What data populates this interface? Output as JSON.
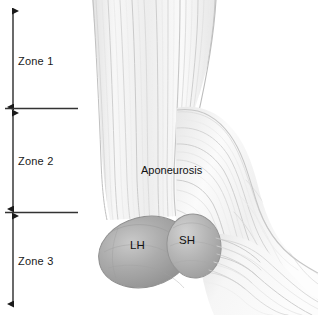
{
  "figure": {
    "background_color": "#ffffff",
    "width": 318,
    "height": 315
  },
  "zone_scale": {
    "axis_color": "#1a1a1a",
    "divider_color": "#333333",
    "zones": [
      {
        "id": "zone-1",
        "label": "Zone 1",
        "top_y": 10,
        "bottom_y": 108,
        "label_x": 18,
        "label_y": 55
      },
      {
        "id": "zone-2",
        "label": "Zone 2",
        "top_y": 110,
        "bottom_y": 210,
        "label_x": 18,
        "label_y": 155
      },
      {
        "id": "zone-3",
        "label": "Zone 3",
        "top_y": 214,
        "bottom_y": 305,
        "label_x": 18,
        "label_y": 255
      }
    ],
    "dividers": [
      {
        "id": "divider-zone-1-2",
        "y": 108,
        "x_start": 5,
        "x_end": 78
      },
      {
        "id": "divider-zone-2-3",
        "y": 212,
        "x_start": 5,
        "x_end": 78
      }
    ],
    "arrow_x": 13
  },
  "anatomy": {
    "aponeurosis_label": "Aponeurosis",
    "long_head_label": "LH",
    "short_head_label": "SH",
    "colors": {
      "fiber_light": "#f2f2f2",
      "fiber_mid": "#dcdcdc",
      "fiber_dark": "#c4c4c4",
      "belly_long_head": "#a8a8a8",
      "belly_short_head": "#b4b4b4",
      "belly_outline": "#8f8f8f",
      "text": "#111111"
    }
  }
}
